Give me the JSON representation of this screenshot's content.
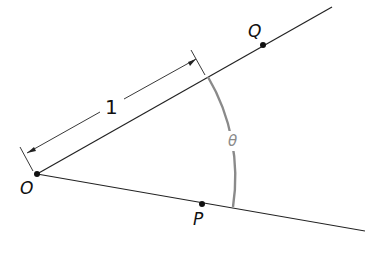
{
  "diagram": {
    "title": "",
    "points": {
      "O": {
        "label": "O",
        "x": 37,
        "y": 174
      },
      "P": {
        "label": "P",
        "x": 202,
        "y": 204
      },
      "Q": {
        "label": "Q",
        "x": 263,
        "y": 45
      }
    },
    "angle_label": "θ",
    "length_label": "1",
    "colors": {
      "line": "#222222",
      "arc": "#8a8a8a",
      "angle_label": "#8a8a8a",
      "point": "#111111"
    }
  }
}
